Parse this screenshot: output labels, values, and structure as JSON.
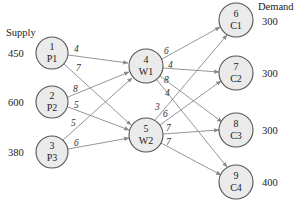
{
  "headers": {
    "supply": "Supply",
    "demand": "Demand"
  },
  "colors": {
    "node_fill": "#ebebeb",
    "node_stroke": "#555555",
    "edge": "#8a8a8a"
  },
  "nodes": [
    {
      "id": "1",
      "label": "P1",
      "x": 52,
      "y": 53,
      "value": "450",
      "type": "plant"
    },
    {
      "id": "2",
      "label": "P2",
      "x": 52,
      "y": 102,
      "value": "600",
      "type": "plant"
    },
    {
      "id": "3",
      "label": "P3",
      "x": 52,
      "y": 152,
      "value": "380",
      "type": "plant"
    },
    {
      "id": "4",
      "label": "W1",
      "x": 146,
      "y": 66,
      "type": "warehouse"
    },
    {
      "id": "5",
      "label": "W2",
      "x": 146,
      "y": 135,
      "type": "warehouse"
    },
    {
      "id": "6",
      "label": "C1",
      "x": 236,
      "y": 20,
      "value": "300",
      "type": "customer"
    },
    {
      "id": "7",
      "label": "C2",
      "x": 236,
      "y": 73,
      "value": "300",
      "type": "customer"
    },
    {
      "id": "8",
      "label": "C3",
      "x": 236,
      "y": 130,
      "value": "300",
      "type": "customer"
    },
    {
      "id": "9",
      "label": "C4",
      "x": 236,
      "y": 182,
      "value": "400",
      "type": "customer"
    }
  ],
  "edges": [
    {
      "from": "1",
      "to": "4",
      "cost": "4"
    },
    {
      "from": "1",
      "to": "5",
      "cost": "7"
    },
    {
      "from": "2",
      "to": "4",
      "cost": "8"
    },
    {
      "from": "2",
      "to": "5",
      "cost": "5"
    },
    {
      "from": "3",
      "to": "4",
      "cost": "5"
    },
    {
      "from": "3",
      "to": "5",
      "cost": "6"
    },
    {
      "from": "4",
      "to": "6",
      "cost": "6"
    },
    {
      "from": "4",
      "to": "7",
      "cost": "4"
    },
    {
      "from": "4",
      "to": "8",
      "cost": "8"
    },
    {
      "from": "4",
      "to": "9",
      "cost": "4"
    },
    {
      "from": "5",
      "to": "6",
      "cost": "3"
    },
    {
      "from": "5",
      "to": "7",
      "cost": "6"
    },
    {
      "from": "5",
      "to": "8",
      "cost": "7"
    },
    {
      "from": "5",
      "to": "9",
      "cost": "7"
    }
  ]
}
